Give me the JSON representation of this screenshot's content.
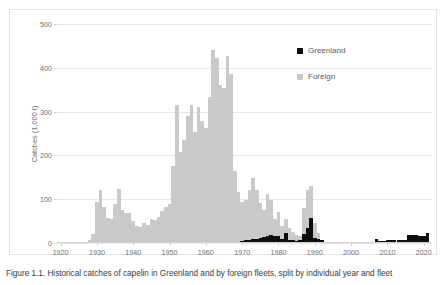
{
  "figure": {
    "caption": "Figure 1.1. Historical catches of capelin in Greenland and by foreign fleets, split by individual year and fleet"
  },
  "legend": {
    "position": "inside-top-right",
    "entries": [
      {
        "label": "Greenland",
        "color": "#0d0d0d",
        "swatch": "square-marker-icon"
      },
      {
        "label": "Foreign",
        "color": "#c9c9c9",
        "swatch": "square-marker-icon"
      }
    ]
  },
  "chart_data": {
    "type": "bar",
    "title": "",
    "subtitle": "",
    "xlabel": "",
    "ylabel": "Catches (1,000 t)",
    "xlim": [
      1919,
      2022
    ],
    "ylim": [
      0,
      500
    ],
    "ytick_values": [
      0,
      100,
      200,
      300,
      400,
      500
    ],
    "ytick_labels": [
      "0",
      "100",
      "200",
      "300",
      "400",
      "500"
    ],
    "xtick_values": [
      1920,
      1930,
      1940,
      1950,
      1960,
      1970,
      1980,
      1990,
      2000,
      2010,
      2020
    ],
    "xtick_labels": [
      "1920",
      "1930",
      "1940",
      "1950",
      "1960",
      "1970",
      "1980",
      "1990",
      "2000",
      "2010",
      "2020"
    ],
    "grid": "horizontal",
    "stacked": true,
    "bar_width_years": 1,
    "colors": {
      "Greenland": "#0d0d0d",
      "Foreign": "#c9c9c9"
    },
    "x": [
      1920,
      1921,
      1922,
      1923,
      1924,
      1925,
      1926,
      1927,
      1928,
      1929,
      1930,
      1931,
      1932,
      1933,
      1934,
      1935,
      1936,
      1937,
      1938,
      1939,
      1940,
      1941,
      1942,
      1943,
      1944,
      1945,
      1946,
      1947,
      1948,
      1949,
      1950,
      1951,
      1952,
      1953,
      1954,
      1955,
      1956,
      1957,
      1958,
      1959,
      1960,
      1961,
      1962,
      1963,
      1964,
      1965,
      1966,
      1967,
      1968,
      1969,
      1970,
      1971,
      1972,
      1973,
      1974,
      1975,
      1976,
      1977,
      1978,
      1979,
      1980,
      1981,
      1982,
      1983,
      1984,
      1985,
      1986,
      1987,
      1988,
      1989,
      1990,
      1991,
      1992,
      1993,
      1994,
      1995,
      1996,
      1997,
      1998,
      1999,
      2000,
      2001,
      2002,
      2003,
      2004,
      2005,
      2006,
      2007,
      2008,
      2009,
      2010,
      2011,
      2012,
      2013,
      2014,
      2015,
      2016,
      2017,
      2018,
      2019,
      2020,
      2021
    ],
    "series": [
      {
        "name": "Foreign",
        "color": "#c9c9c9",
        "values": [
          0,
          0,
          0,
          0,
          0,
          0,
          2,
          3,
          6,
          20,
          93,
          120,
          83,
          56,
          55,
          88,
          123,
          75,
          68,
          69,
          50,
          38,
          37,
          46,
          41,
          55,
          53,
          60,
          73,
          82,
          88,
          175,
          316,
          208,
          235,
          289,
          316,
          254,
          310,
          278,
          262,
          334,
          440,
          423,
          360,
          354,
          427,
          387,
          165,
          117,
          90,
          92,
          115,
          140,
          110,
          80,
          62,
          96,
          80,
          38,
          55,
          30,
          33,
          27,
          18,
          14,
          10,
          60,
          87,
          72,
          33,
          12,
          0,
          0,
          0,
          0,
          0,
          0,
          0,
          0,
          0,
          0,
          0,
          0,
          0,
          0,
          0,
          0,
          0,
          0,
          0,
          0,
          0,
          0,
          0,
          0,
          0,
          0,
          0,
          0,
          0,
          0
        ]
      },
      {
        "name": "Greenland",
        "color": "#0d0d0d",
        "values": [
          0,
          0,
          0,
          0,
          0,
          0,
          0,
          0,
          0,
          0,
          0,
          0,
          0,
          0,
          0,
          0,
          0,
          0,
          0,
          0,
          0,
          0,
          0,
          0,
          0,
          0,
          0,
          0,
          0,
          0,
          0,
          0,
          0,
          0,
          0,
          0,
          0,
          0,
          0,
          0,
          0,
          0,
          0,
          0,
          0,
          0,
          0,
          0,
          0,
          0,
          4,
          6,
          7,
          9,
          10,
          12,
          13,
          15,
          18,
          17,
          15,
          10,
          22,
          8,
          7,
          5,
          6,
          20,
          34,
          58,
          12,
          10,
          8,
          0,
          0,
          0,
          0,
          0,
          0,
          0,
          0,
          0,
          0,
          0,
          0,
          0,
          0,
          10,
          4,
          5,
          6,
          6,
          6,
          7,
          8,
          8,
          18,
          18,
          18,
          17,
          16,
          23
        ]
      }
    ]
  }
}
